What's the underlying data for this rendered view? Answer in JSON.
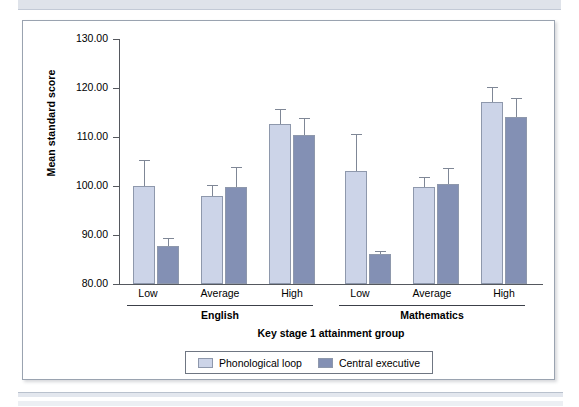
{
  "figure": {
    "panel_border_color": "#9aa3b0",
    "background": "#ffffff"
  },
  "chart_data": {
    "type": "bar",
    "title": "",
    "xlabel": "Key stage 1 attainment group",
    "ylabel": "Mean standard score",
    "ylim": [
      80,
      130
    ],
    "ytick_labels": [
      "80.00",
      "90.00",
      "100.00",
      "110.00",
      "120.00",
      "130.00"
    ],
    "ytick_values": [
      80,
      90,
      100,
      110,
      120,
      130
    ],
    "grid": false,
    "legend_position": "bottom",
    "group_labels": [
      "English",
      "Mathematics"
    ],
    "categories": [
      "Low",
      "Average",
      "High",
      "Low",
      "Average",
      "High"
    ],
    "series": [
      {
        "name": "Phonological loop",
        "color": "#ccd4e8",
        "values": [
          99.9,
          98.0,
          112.7,
          103.0,
          99.7,
          117.1
        ],
        "errors": [
          5.4,
          2.2,
          3.0,
          7.6,
          2.2,
          3.2
        ]
      },
      {
        "name": "Central executive",
        "color": "#8390b4",
        "values": [
          87.8,
          99.8,
          110.5,
          86.2,
          100.5,
          114.0
        ],
        "errors": [
          1.6,
          4.0,
          3.4,
          0.5,
          3.2,
          4.0
        ]
      }
    ]
  },
  "legend": {
    "items": [
      {
        "label": "Phonological loop",
        "swatch": "light"
      },
      {
        "label": "Central executive",
        "swatch": "dark"
      }
    ]
  }
}
